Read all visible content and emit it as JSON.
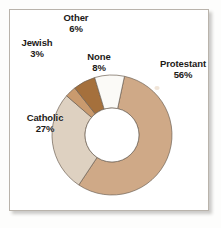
{
  "figure": {
    "background_color": "#fdfdfc",
    "panel_color": "#ffffff",
    "border_color": "#b9b3ab"
  },
  "chart_data": {
    "type": "pie",
    "variant": "donut",
    "title": "",
    "subtitle": "",
    "xlabel": "",
    "ylabel": "",
    "legend_position": "none",
    "labels_inline": true,
    "units": "percent",
    "total": 100,
    "categories": [
      "Protestant",
      "Catholic",
      "None",
      "Other",
      "Jewish"
    ],
    "values": [
      56,
      27,
      8,
      6,
      3
    ],
    "value_labels": [
      "56%",
      "27%",
      "8%",
      "6%",
      "3%"
    ],
    "colors": [
      "#cfa987",
      "#ded1c1",
      "#fbfaf7",
      "#a5703c",
      "#c99a6e"
    ],
    "slices": [
      {
        "name": "Protestant",
        "value": 56,
        "value_label": "56%",
        "color": "#cfa987",
        "start_angle": 12,
        "end_angle": 213.6
      },
      {
        "name": "Catholic",
        "value": 27,
        "value_label": "27%",
        "color": "#ded1c1",
        "start_angle": 213.6,
        "end_angle": 310.8
      },
      {
        "name": "Jewish",
        "value": 3,
        "value_label": "3%",
        "color": "#c99a6e",
        "start_angle": 310.8,
        "end_angle": 321.6
      },
      {
        "name": "Other",
        "value": 6,
        "value_label": "6%",
        "color": "#a5703c",
        "start_angle": 321.6,
        "end_angle": 343.2
      },
      {
        "name": "None",
        "value": 8,
        "value_label": "8%",
        "color": "#fbfaf7",
        "start_angle": 343.2,
        "end_angle": 372
      }
    ],
    "geometry": {
      "center_x": 112,
      "center_y": 135,
      "outer_radius": 60,
      "inner_radius": 27,
      "stroke_color": "#6f6154",
      "stroke_width": 0.7
    }
  },
  "labels": {
    "protestant": {
      "name": "Protestant",
      "percent": "56%"
    },
    "catholic": {
      "name": "Catholic",
      "percent": "27%"
    },
    "none": {
      "name": "None",
      "percent": "8%"
    },
    "other": {
      "name": "Other",
      "percent": "6%"
    },
    "jewish": {
      "name": "Jewish",
      "percent": "3%"
    }
  }
}
